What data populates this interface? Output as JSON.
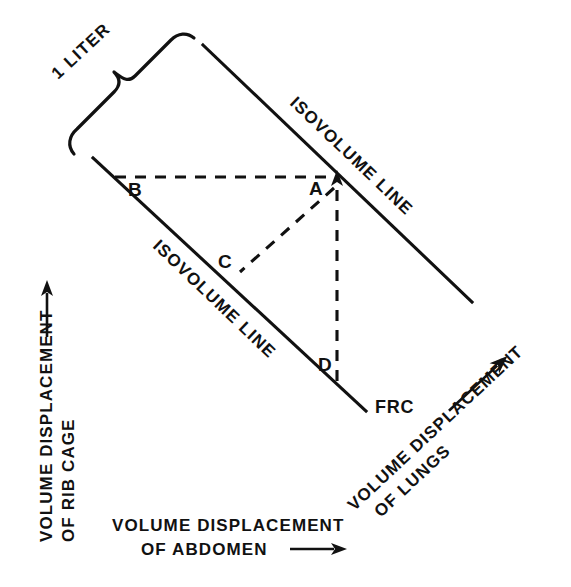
{
  "figure": {
    "background_color": "#ffffff",
    "ink_color": "#111111"
  },
  "axes": {
    "left": {
      "line1": "VOLUME DISPLACEMENT",
      "line2": "OF RIB CAGE",
      "arrow": "up-arrow-icon",
      "rotation_deg": -90
    },
    "bottom": {
      "line1": "VOLUME DISPLACEMENT",
      "line2": "OF ABDOMEN",
      "arrow": "right-arrow-icon",
      "rotation_deg": 0
    },
    "right": {
      "line1": "VOLUME DISPLACEMENT",
      "line2": "OF LUNGS",
      "arrow": "up-right-arrow-icon",
      "rotation_deg": -45
    }
  },
  "scale_marker": {
    "label": "1 LITER",
    "brace": "curly-brace-icon",
    "rotation_deg": -45
  },
  "iso_lines": [
    {
      "id": "upper",
      "label": "ISOVOLUME LINE",
      "x1": 203,
      "y1": 45,
      "x2": 472,
      "y2": 302
    },
    {
      "id": "lower",
      "label": "ISOVOLUME LINE",
      "x1": 93,
      "y1": 158,
      "x2": 366,
      "y2": 411
    }
  ],
  "points": [
    {
      "id": "A",
      "label": "A",
      "x": 337,
      "y": 177,
      "on": "upper-isovolume-line"
    },
    {
      "id": "B",
      "label": "B",
      "x": 115,
      "y": 177,
      "on": "lower-isovolume-line"
    },
    {
      "id": "C",
      "label": "C",
      "x": 238,
      "y": 273,
      "on": "lower-isovolume-line"
    },
    {
      "id": "D",
      "label": "D",
      "x": 337,
      "y": 370,
      "on": "lower-isovolume-line"
    }
  ],
  "dashed_paths": [
    {
      "id": "B-A",
      "from": "B",
      "to": "A",
      "kind": "horizontal"
    },
    {
      "id": "A-C",
      "from": "A",
      "to": "C",
      "kind": "diagonal"
    },
    {
      "id": "A-D",
      "from": "A",
      "to": "D",
      "kind": "vertical"
    }
  ],
  "annotations": {
    "frc": "FRC"
  }
}
